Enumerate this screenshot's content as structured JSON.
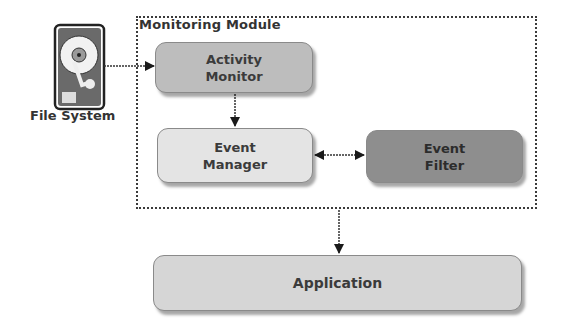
{
  "diagram": {
    "module": {
      "title": "Monitoring Module"
    },
    "file_system": {
      "label": "File System",
      "icon": "hard-drive-icon"
    },
    "nodes": {
      "activity_monitor": {
        "line1": "Activity",
        "line2": "Monitor"
      },
      "event_manager": {
        "line1": "Event",
        "line2": "Manager"
      },
      "event_filter": {
        "line1": "Event",
        "line2": "Filter"
      },
      "application": {
        "label": "Application"
      }
    },
    "edges": [
      {
        "from": "File System",
        "to": "Activity Monitor",
        "type": "directed"
      },
      {
        "from": "Activity Monitor",
        "to": "Event Manager",
        "type": "directed"
      },
      {
        "from": "Event Manager",
        "to": "Event Filter",
        "type": "bidirectional"
      },
      {
        "from": "Monitoring Module",
        "to": "Application",
        "type": "directed"
      }
    ],
    "colors": {
      "activity_monitor": "#bdbdbd",
      "event_manager": "#e4e4e4",
      "event_filter": "#8e8e8e",
      "application": "#d6d6d6"
    }
  }
}
